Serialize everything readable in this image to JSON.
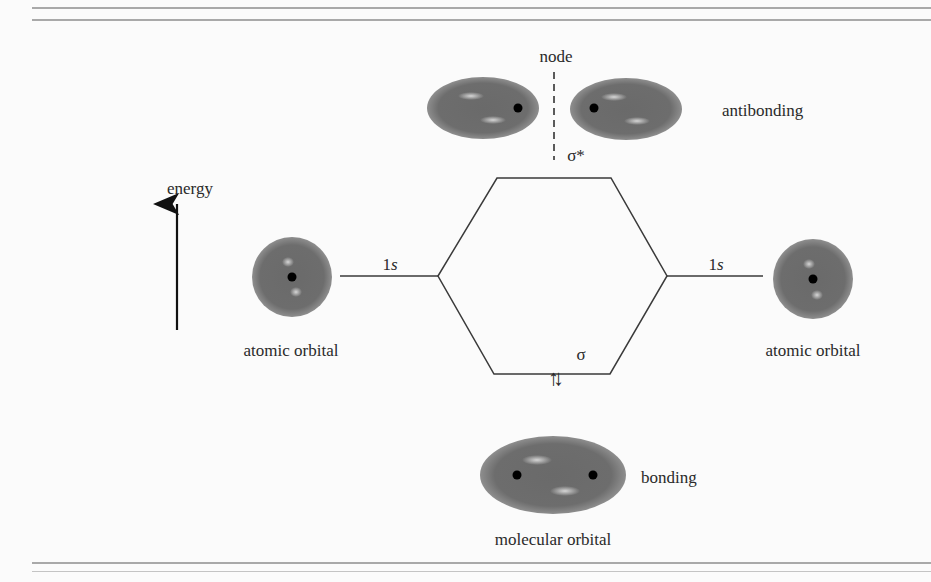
{
  "axis": {
    "label": "energy",
    "direction": "up"
  },
  "left_atom": {
    "orbital_label": "1s",
    "caption": "atomic orbital"
  },
  "right_atom": {
    "orbital_label": "1s",
    "caption": "atomic orbital"
  },
  "antibonding": {
    "symbol": "σ*",
    "caption": "antibonding",
    "node_label": "node"
  },
  "bonding": {
    "symbol": "σ",
    "caption": "bonding",
    "electrons": "↑↓",
    "group_caption": "molecular orbital"
  },
  "colors": {
    "orbital_fill": "#6b6b6b",
    "orbital_edge": "#8a8a8a",
    "highlight": "#c9c9c9",
    "nucleus": "#000000",
    "line": "#3a3a3a",
    "rule": "#a9a9a9",
    "background": "#fbfbfb"
  }
}
